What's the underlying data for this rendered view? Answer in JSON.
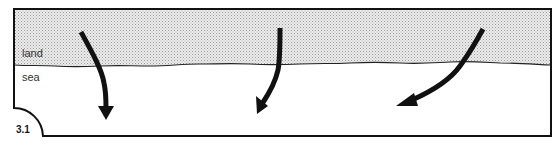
{
  "figure": {
    "number": "3.1",
    "regions": {
      "land_label": "land",
      "sea_label": "sea"
    },
    "arrows": [
      {
        "id": "arrow-left",
        "direction": "down, from land across coastline into sea"
      },
      {
        "id": "arrow-middle",
        "direction": "down-left, from land across coastline into sea"
      },
      {
        "id": "arrow-right",
        "direction": "left-down, from land across coastline into sea"
      }
    ],
    "colors": {
      "ink": "#111111",
      "land_fill": "#e4e4e4",
      "stipple": "#9a9a9a",
      "sea_fill": "#ffffff"
    }
  }
}
